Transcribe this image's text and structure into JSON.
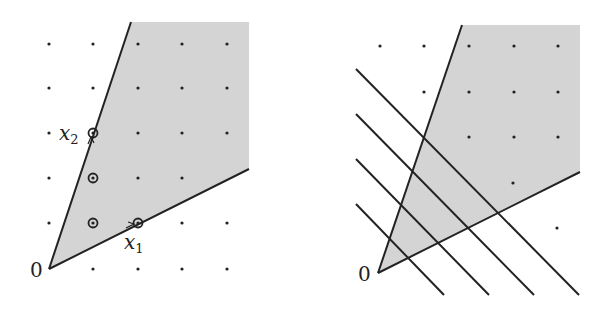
{
  "figure": {
    "left_panel": {
      "origin_label": "0",
      "x1_label": "x",
      "x1_sub": "1",
      "x2_label": "x",
      "x2_sub": "2",
      "description": "Cone generated by x1 and x2 (shaded), lattice points, Hilbert basis points circled",
      "circled_points": [
        [
          1,
          1
        ],
        [
          1,
          2
        ],
        [
          2,
          1
        ],
        [
          1,
          3
        ]
      ],
      "generators": {
        "x1": [
          2,
          1
        ],
        "x2": [
          1,
          3
        ]
      }
    },
    "right_panel": {
      "origin_label": "0",
      "description": "Same cone with parallel lines (level sets of a linear functional) crossing it",
      "parallel_line_count": 4
    },
    "colors": {
      "cone_fill": "#d4d4d4",
      "line": "#222222",
      "dot": "#222222",
      "background": "#ffffff"
    }
  }
}
